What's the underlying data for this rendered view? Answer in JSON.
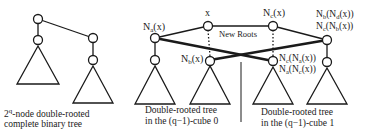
{
  "diagram": {
    "left_tree": {
      "caption_line1": "-node double-rooted",
      "caption_base": "2",
      "caption_sup": "q",
      "caption_line2": "complete binary tree"
    },
    "labels": {
      "na": "N",
      "na_sub": "a",
      "na_arg": "(x)",
      "x": "x",
      "nb": "N",
      "nb_sub": "b",
      "nb_arg": "(x)",
      "nc": "N",
      "nc_sub": "c",
      "nc_arg": "(x)",
      "new_roots": "New Roots",
      "right_top_1": "N",
      "right_top_1_sub": "b",
      "right_top_1_arg": "(N",
      "right_top_1_sub2": "d",
      "right_top_1_end": "(x))",
      "right_top_2": "N",
      "right_top_2_sub": "c",
      "right_top_2_arg": "(N",
      "right_top_2_sub2": "b",
      "right_top_2_end": "(x))",
      "mid_right_1": "N",
      "mid_right_1_sub": "c",
      "mid_right_1_arg": "(N",
      "mid_right_1_sub2": "a",
      "mid_right_1_end": "(x))",
      "mid_right_2": "N",
      "mid_right_2_sub": "a",
      "mid_right_2_arg": "(N",
      "mid_right_2_sub2": "c",
      "mid_right_2_end": "(x))"
    },
    "captions": {
      "cube0_line1": "Double-rooted tree",
      "cube0_line2": "in the (q−1)-cube 0",
      "cube1_line1": "Double-rooted tree",
      "cube1_line2": "in the (q−1)-cube 1"
    },
    "colors": {
      "stroke": "#1a1a1a",
      "background": "#ffffff"
    }
  }
}
